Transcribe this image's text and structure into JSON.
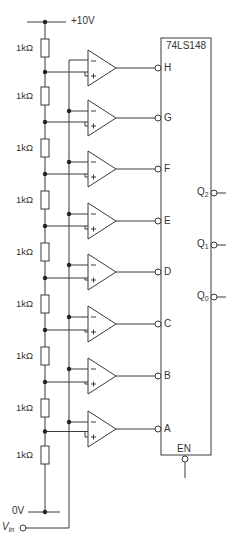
{
  "ic": {
    "name": "74LS148",
    "enable_label": "EN"
  },
  "supply": {
    "top": "+10V",
    "bottom": "0V",
    "input_label": "V",
    "input_sub": "in"
  },
  "resistors": [
    {
      "label": "1kΩ",
      "y": 48
    },
    {
      "label": "1kΩ",
      "y": 96
    },
    {
      "label": "1kΩ",
      "y": 148
    },
    {
      "label": "1kΩ",
      "y": 200
    },
    {
      "label": "1kΩ",
      "y": 252
    },
    {
      "label": "1kΩ",
      "y": 304
    },
    {
      "label": "1kΩ",
      "y": 356
    },
    {
      "label": "1kΩ",
      "y": 408
    },
    {
      "label": "1kΩ",
      "y": 455
    }
  ],
  "inputs": [
    {
      "label": "H",
      "y": 68
    },
    {
      "label": "G",
      "y": 118
    },
    {
      "label": "F",
      "y": 169
    },
    {
      "label": "E",
      "y": 221
    },
    {
      "label": "D",
      "y": 272
    },
    {
      "label": "C",
      "y": 324
    },
    {
      "label": "B",
      "y": 376
    },
    {
      "label": "A",
      "y": 429
    }
  ],
  "outputs": [
    {
      "label": "Q",
      "sub": "2",
      "y": 193
    },
    {
      "label": "Q",
      "sub": "1",
      "y": 245
    },
    {
      "label": "Q",
      "sub": "0",
      "y": 297
    }
  ],
  "colors": {
    "line": "#3a3a3a",
    "background": "#ffffff"
  }
}
